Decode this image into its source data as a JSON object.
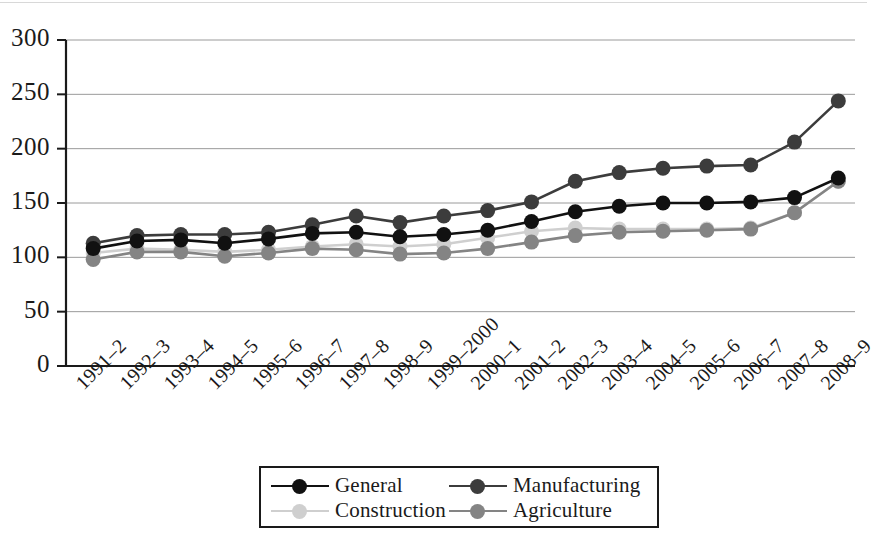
{
  "chart_data": {
    "type": "line",
    "title": "",
    "subtitle": "",
    "xlabel": "",
    "ylabel": "",
    "ylim": [
      0,
      300
    ],
    "yticks": [
      0,
      50,
      100,
      150,
      200,
      250,
      300
    ],
    "grid": true,
    "legend_position": "bottom-center",
    "categories": [
      "1991–2",
      "1992–3",
      "1993–4",
      "1994–5",
      "1995–6",
      "1996–7",
      "1997–8",
      "1998–9",
      "1999–2000",
      "2000–1",
      "2001–2",
      "2002–3",
      "2003–4",
      "2004–5",
      "2005–6",
      "2006–7",
      "2007–8",
      "2008–9"
    ],
    "series": [
      {
        "name": "General",
        "color": "#111111",
        "values": [
          108,
          115,
          116,
          113,
          117,
          122,
          123,
          119,
          121,
          125,
          133,
          142,
          147,
          150,
          150,
          151,
          155,
          173
        ]
      },
      {
        "name": "Manufacturing",
        "color": "#3c3c3c",
        "values": [
          113,
          120,
          121,
          121,
          123,
          130,
          138,
          132,
          138,
          143,
          151,
          170,
          178,
          182,
          184,
          185,
          206,
          244
        ]
      },
      {
        "name": "Construction",
        "color": "#cfcfcf",
        "values": [
          104,
          108,
          107,
          105,
          107,
          110,
          112,
          110,
          112,
          118,
          124,
          127,
          126,
          126,
          126,
          127,
          141,
          170
        ]
      },
      {
        "name": "Agriculture",
        "color": "#848484",
        "values": [
          98,
          105,
          105,
          101,
          104,
          108,
          107,
          103,
          104,
          108,
          114,
          120,
          123,
          124,
          125,
          126,
          141,
          170
        ]
      }
    ]
  },
  "legend": {
    "entries": [
      {
        "label": "General",
        "color": "#111111"
      },
      {
        "label": "Manufacturing",
        "color": "#3c3c3c"
      },
      {
        "label": "Construction",
        "color": "#cfcfcf"
      },
      {
        "label": "Agriculture",
        "color": "#848484"
      }
    ]
  },
  "axes": {
    "y_tick_labels": [
      "300",
      "250",
      "200",
      "150",
      "100",
      "50",
      "0"
    ]
  }
}
